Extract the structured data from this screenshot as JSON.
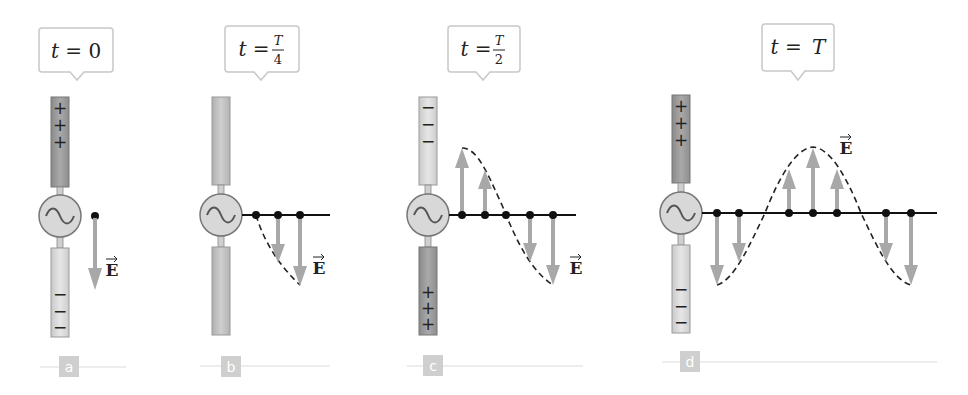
{
  "figure": {
    "colors": {
      "rod_positive": "#9a9a9a",
      "rod_negative": "#d9d9d9",
      "arrow": "#a8a8a8",
      "line": "#111111",
      "callout_border": "#c8c8c8",
      "label_bg": "#cfcfcf",
      "label_line": "#dcdcdc"
    },
    "panels": [
      {
        "id": "a",
        "label": "a",
        "time_label": {
          "prefix": "t = ",
          "value": "0"
        },
        "upper_rod_charge": "+",
        "lower_rod_charge": "−",
        "field_label": "E",
        "source_icon": "ac-source-icon"
      },
      {
        "id": "b",
        "label": "b",
        "time_label": {
          "prefix": "t = ",
          "numerator": "T",
          "denominator": "4"
        },
        "upper_rod_charge": "none",
        "lower_rod_charge": "none",
        "field_label": "E",
        "source_icon": "ac-source-icon"
      },
      {
        "id": "c",
        "label": "c",
        "time_label": {
          "prefix": "t = ",
          "numerator": "T",
          "denominator": "2"
        },
        "upper_rod_charge": "−",
        "lower_rod_charge": "+",
        "field_label": "E",
        "source_icon": "ac-source-icon"
      },
      {
        "id": "d",
        "label": "d",
        "time_label": {
          "prefix": "t = ",
          "value": "T"
        },
        "upper_rod_charge": "+",
        "lower_rod_charge": "−",
        "field_label": "E",
        "source_icon": "ac-source-icon"
      }
    ],
    "signs": {
      "plus": "+",
      "minus": "−"
    },
    "tilde": "~"
  }
}
